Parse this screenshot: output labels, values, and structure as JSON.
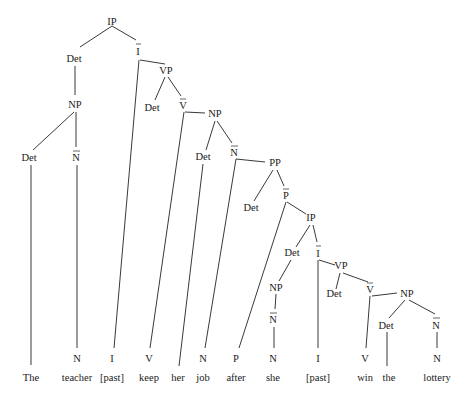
{
  "diagram": {
    "type": "syntax-tree",
    "sentence": [
      "The",
      "teacher",
      "[past]",
      "keep",
      "her",
      "job",
      "after",
      "she",
      "[past]",
      "win",
      "the",
      "lottery"
    ],
    "nodes": [
      {
        "id": "ip1",
        "label": "IP",
        "x": 112,
        "y": 22,
        "bar": false
      },
      {
        "id": "det1",
        "label": "Det",
        "x": 74,
        "y": 62,
        "bar": false
      },
      {
        "id": "ibar1",
        "label": "I",
        "x": 138,
        "y": 52,
        "bar": true
      },
      {
        "id": "np1",
        "label": "NP",
        "x": 75,
        "y": 108,
        "bar": false
      },
      {
        "id": "det2",
        "label": "Det",
        "x": 29,
        "y": 161,
        "bar": false
      },
      {
        "id": "nbar1",
        "label": "N",
        "x": 76,
        "y": 161,
        "bar": true
      },
      {
        "id": "vp1",
        "label": "VP",
        "x": 166,
        "y": 73,
        "bar": false
      },
      {
        "id": "det3",
        "label": "Det",
        "x": 152,
        "y": 111,
        "bar": false
      },
      {
        "id": "vbar1",
        "label": "V",
        "x": 183,
        "y": 108,
        "bar": true
      },
      {
        "id": "np2",
        "label": "NP",
        "x": 215,
        "y": 117,
        "bar": false
      },
      {
        "id": "det4",
        "label": "Det",
        "x": 203,
        "y": 160,
        "bar": false
      },
      {
        "id": "nbar2",
        "label": "N",
        "x": 234,
        "y": 155,
        "bar": true
      },
      {
        "id": "pp1",
        "label": "PP",
        "x": 275,
        "y": 166,
        "bar": false
      },
      {
        "id": "det5",
        "label": "Det",
        "x": 251,
        "y": 211,
        "bar": false
      },
      {
        "id": "pbar1",
        "label": "P",
        "x": 286,
        "y": 198,
        "bar": true
      },
      {
        "id": "ip2",
        "label": "IP",
        "x": 311,
        "y": 221,
        "bar": false
      },
      {
        "id": "det6",
        "label": "Det",
        "x": 292,
        "y": 256,
        "bar": false
      },
      {
        "id": "ibar2",
        "label": "I",
        "x": 318,
        "y": 256,
        "bar": true
      },
      {
        "id": "np3",
        "label": "NP",
        "x": 276,
        "y": 290,
        "bar": false
      },
      {
        "id": "nbar3",
        "label": "N",
        "x": 273,
        "y": 323,
        "bar": true
      },
      {
        "id": "vp2",
        "label": "VP",
        "x": 341,
        "y": 269,
        "bar": false
      },
      {
        "id": "det7",
        "label": "Det",
        "x": 334,
        "y": 297,
        "bar": false
      },
      {
        "id": "vbar2",
        "label": "V",
        "x": 370,
        "y": 292,
        "bar": true
      },
      {
        "id": "np4",
        "label": "NP",
        "x": 407,
        "y": 296,
        "bar": false
      },
      {
        "id": "det8",
        "label": "Det",
        "x": 386,
        "y": 328,
        "bar": false
      },
      {
        "id": "nbar4",
        "label": "N",
        "x": 436,
        "y": 328,
        "bar": true
      }
    ],
    "terminals": [
      {
        "cat": "",
        "word": "The",
        "x": 31
      },
      {
        "cat": "N",
        "word": "teacher",
        "x": 77
      },
      {
        "cat": "I",
        "word": "[past]",
        "x": 112
      },
      {
        "cat": "V",
        "word": "keep",
        "x": 149
      },
      {
        "cat": "",
        "word": "her",
        "x": 178
      },
      {
        "cat": "N",
        "word": "job",
        "x": 203
      },
      {
        "cat": "P",
        "word": "after",
        "x": 236
      },
      {
        "cat": "N",
        "word": "she",
        "x": 273
      },
      {
        "cat": "I",
        "word": "[past]",
        "x": 318
      },
      {
        "cat": "V",
        "word": "win",
        "x": 365
      },
      {
        "cat": "",
        "word": "the",
        "x": 389
      },
      {
        "cat": "N",
        "word": "lottery",
        "x": 437
      }
    ]
  },
  "labels": {
    "ip1": "IP",
    "det1": "Det",
    "ibar1": "I",
    "np1": "NP",
    "det2": "Det",
    "nbar1": "N",
    "vp1": "VP",
    "det3": "Det",
    "vbar1": "V",
    "np2": "NP",
    "det4": "Det",
    "nbar2": "N",
    "pp1": "PP",
    "det5": "Det",
    "pbar1": "P",
    "ip2": "IP",
    "det6": "Det",
    "ibar2": "I",
    "np3": "NP",
    "nbar3": "N",
    "vp2": "VP",
    "det7": "Det",
    "vbar2": "V",
    "np4": "NP",
    "det8": "Det",
    "nbar4": "N",
    "cat_teacher": "N",
    "cat_past1": "I",
    "cat_keep": "V",
    "cat_job": "N",
    "cat_after": "P",
    "cat_she": "N",
    "cat_past2": "I",
    "cat_win": "V",
    "cat_lottery": "N",
    "w_the1": "The",
    "w_teacher": "teacher",
    "w_past1": "[past]",
    "w_keep": "keep",
    "w_her": "her",
    "w_job": "job",
    "w_after": "after",
    "w_she": "she",
    "w_past2": "[past]",
    "w_win": "win",
    "w_the2": "the",
    "w_lottery": "lottery"
  }
}
